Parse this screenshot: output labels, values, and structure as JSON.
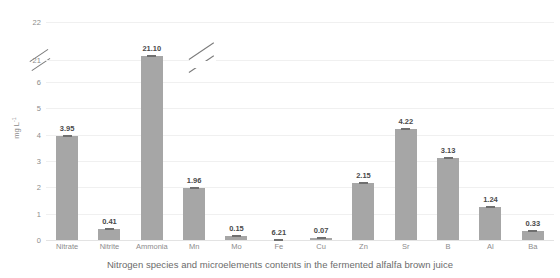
{
  "caption": "Nitrogen species and microelements contents in the fermented alfalfa brown juice",
  "chart_data": {
    "type": "bar",
    "title": "",
    "xlabel": "",
    "ylabel": "mg L-1",
    "ylabel_base": "mg L",
    "ylabel_sup": "-1",
    "categories": [
      "Nitrate",
      "Nitrite",
      "Ammonia",
      "Mn",
      "Mo",
      "Fe",
      "Cu",
      "Zn",
      "Sr",
      "B",
      "Al",
      "Ba"
    ],
    "values": [
      3.95,
      0.41,
      21.1,
      1.96,
      0.15,
      6.21,
      0.07,
      2.15,
      4.22,
      3.13,
      1.24,
      0.33
    ],
    "value_labels": [
      "3.95",
      "0.41",
      "21.10",
      "1.96",
      "0.15",
      "6.21",
      "0.07",
      "2.15",
      "4.22",
      "3.13",
      "1.24",
      "0.33"
    ],
    "ytick_labels": [
      "0",
      "1",
      "2",
      "3",
      "4",
      "5",
      "6",
      "21",
      "22"
    ],
    "ylim": [
      0,
      22
    ],
    "axis_break": true,
    "axis_break_range": [
      6,
      21
    ],
    "grid": true,
    "legend": "none",
    "bar_color": "#a6a6a6",
    "error_bars": true,
    "text_color": "#8c8c8c"
  }
}
